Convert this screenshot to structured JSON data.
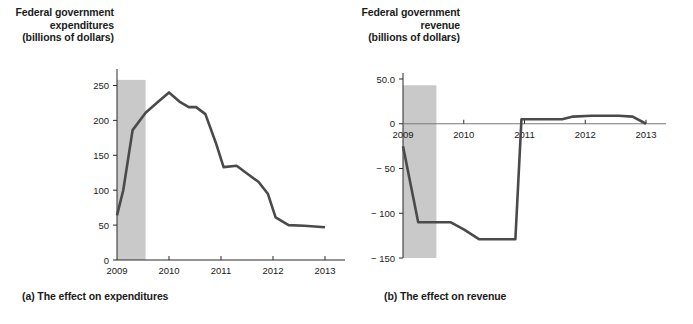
{
  "figure": {
    "background_color": "#ffffff",
    "line_color": "#4a4a4a",
    "band_color": "#c9c9c9",
    "axis_color": "#2b2b2b"
  },
  "panel_a": {
    "title": "Federal government\nexpenditures\n(billions of dollars)",
    "caption": "(a) The effect on expenditures"
  },
  "panel_b": {
    "title": "Federal government\nrevenue\n(billions of dollars)",
    "caption": "(b) The effect on revenue"
  },
  "chart_data": [
    {
      "type": "line",
      "id": "expenditures",
      "title": "Federal government expenditures (billions of dollars)",
      "xlabel": "",
      "ylabel": "billions of dollars",
      "xlim": [
        2009.0,
        2013.0
      ],
      "ylim": [
        0,
        265
      ],
      "yticks": [
        0,
        50,
        100,
        150,
        200,
        250
      ],
      "ytick_labels": [
        "0",
        "50",
        "100",
        "150",
        "200",
        "250"
      ],
      "xticks": [
        2009,
        2010,
        2011,
        2012,
        2013
      ],
      "xtick_labels": [
        "2009",
        "2010",
        "2011",
        "2012",
        "2013"
      ],
      "grid": false,
      "legend": "none",
      "shaded_region": {
        "label": "recession",
        "x_start": 2009.0,
        "x_end": 2009.55,
        "y_start": 0,
        "y_end": 258
      },
      "x": [
        2009.0,
        2009.12,
        2009.3,
        2009.55,
        2009.78,
        2010.0,
        2010.2,
        2010.38,
        2010.52,
        2010.7,
        2010.9,
        2011.05,
        2011.3,
        2011.5,
        2011.72,
        2011.9,
        2012.05,
        2012.3,
        2012.6,
        2013.0
      ],
      "y": [
        64,
        100,
        186,
        211,
        226,
        240,
        227,
        219,
        219,
        209,
        168,
        133,
        135,
        124,
        112,
        95,
        61,
        50,
        49,
        47
      ],
      "series": [
        {
          "name": "Federal government expenditures",
          "values": [
            64,
            100,
            186,
            211,
            226,
            240,
            227,
            219,
            219,
            209,
            168,
            133,
            135,
            124,
            112,
            95,
            61,
            50,
            49,
            47
          ]
        }
      ]
    },
    {
      "type": "line",
      "id": "revenue",
      "title": "Federal government revenue (billions of dollars)",
      "xlabel": "",
      "ylabel": "billions of dollars",
      "xlim": [
        2009.0,
        2013.0
      ],
      "ylim": [
        -150,
        50
      ],
      "yticks": [
        50,
        0,
        -50,
        -100,
        -150
      ],
      "ytick_labels": [
        "50.0",
        "0",
        "-50",
        "-100",
        "-150"
      ],
      "xticks": [
        2009,
        2010,
        2011,
        2012,
        2013
      ],
      "xtick_labels": [
        "2009",
        "2010",
        "2011",
        "2012",
        "2013"
      ],
      "grid": false,
      "legend": "none",
      "zero_line": true,
      "shaded_region": {
        "label": "recession",
        "x_start": 2009.0,
        "x_end": 2009.55,
        "y_start": -150,
        "y_end": 43
      },
      "x": [
        2009.0,
        2009.25,
        2009.55,
        2009.78,
        2010.0,
        2010.25,
        2010.6,
        2010.85,
        2010.95,
        2011.3,
        2011.62,
        2011.8,
        2012.1,
        2012.55,
        2012.78,
        2013.0
      ],
      "y": [
        -25,
        -110,
        -110,
        -110,
        -118,
        -129,
        -129,
        -129,
        5,
        5,
        5,
        8,
        9,
        9,
        8,
        0
      ],
      "series": [
        {
          "name": "Federal government revenue",
          "values": [
            -25,
            -110,
            -110,
            -110,
            -118,
            -129,
            -129,
            -129,
            5,
            5,
            5,
            8,
            9,
            9,
            8,
            0
          ]
        }
      ]
    }
  ]
}
